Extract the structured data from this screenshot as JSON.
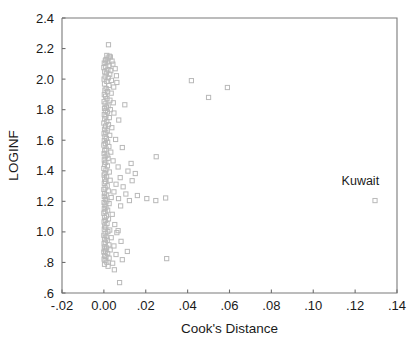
{
  "chart_data": {
    "type": "scatter",
    "title": "",
    "xlabel": "Cook's Distance",
    "ylabel": "LOGINF",
    "xlim": [
      -0.02,
      0.14
    ],
    "ylim": [
      0.6,
      2.4
    ],
    "grid": false,
    "legend": "none",
    "xticks": [
      "-.02",
      "0.00",
      ".02",
      ".04",
      ".06",
      ".08",
      ".10",
      ".12",
      ".14"
    ],
    "xtick_values": [
      -0.02,
      0.0,
      0.02,
      0.04,
      0.06,
      0.08,
      0.1,
      0.12,
      0.14
    ],
    "yticks": [
      "2.4",
      "2.2",
      "2.0",
      "1.8",
      "1.6",
      "1.4",
      "1.2",
      "1.0",
      ".8",
      ".6"
    ],
    "ytick_values": [
      2.4,
      2.2,
      2.0,
      1.8,
      1.6,
      1.4,
      1.2,
      1.0,
      0.8,
      0.6
    ],
    "marker": "open-square",
    "marker_color": "#b9b9b9",
    "annotations": [
      {
        "text": "Kuwait",
        "x": 0.1295,
        "y": 1.205,
        "label_x": 0.1225,
        "label_y": 1.305
      }
    ],
    "points": [
      [
        0.0022,
        2.225
      ],
      [
        0.0014,
        2.155
      ],
      [
        0.0026,
        2.15
      ],
      [
        0.0031,
        2.145
      ],
      [
        0.002,
        2.138
      ],
      [
        0.001,
        2.128
      ],
      [
        0.0007,
        2.12
      ],
      [
        0.0039,
        2.118
      ],
      [
        0.0016,
        2.112
      ],
      [
        0.0002,
        2.105
      ],
      [
        0.0043,
        2.098
      ],
      [
        0.0025,
        2.09
      ],
      [
        0.0009,
        2.082
      ],
      [
        0.0,
        2.075
      ],
      [
        0.0054,
        2.068
      ],
      [
        0.0019,
        2.06
      ],
      [
        0.0033,
        2.055
      ],
      [
        0.0004,
        2.048
      ],
      [
        0.0012,
        2.04
      ],
      [
        0.0028,
        2.032
      ],
      [
        0.006,
        2.022
      ],
      [
        0.0006,
        2.015
      ],
      [
        0.0021,
        2.008
      ],
      [
        0.0001,
        2.0
      ],
      [
        0.0036,
        1.992
      ],
      [
        0.0014,
        1.985
      ],
      [
        0.0062,
        1.978
      ],
      [
        0.0003,
        1.968
      ],
      [
        0.0024,
        1.958
      ],
      [
        0.0047,
        1.948
      ],
      [
        0.059,
        1.945
      ],
      [
        0.0011,
        1.938
      ],
      [
        0.0005,
        1.928
      ],
      [
        0.0418,
        1.99
      ],
      [
        0.0018,
        1.918
      ],
      [
        0.0035,
        1.908
      ],
      [
        0.0002,
        1.898
      ],
      [
        0.0008,
        1.888
      ],
      [
        0.05,
        1.88
      ],
      [
        0.0015,
        1.872
      ],
      [
        0.0029,
        1.862
      ],
      [
        0.0001,
        1.852
      ],
      [
        0.0045,
        1.845
      ],
      [
        0.0006,
        1.838
      ],
      [
        0.01,
        1.832
      ],
      [
        0.002,
        1.825
      ],
      [
        0.0012,
        1.818
      ],
      [
        0.0003,
        1.808
      ],
      [
        0.0031,
        1.8
      ],
      [
        0.0007,
        1.792
      ],
      [
        0.0017,
        1.785
      ],
      [
        0.0048,
        1.778
      ],
      [
        0.0002,
        1.768
      ],
      [
        0.001,
        1.758
      ],
      [
        0.0026,
        1.748
      ],
      [
        0.0004,
        1.74
      ],
      [
        0.0071,
        1.732
      ],
      [
        0.0014,
        1.722
      ],
      [
        0.0,
        1.712
      ],
      [
        0.0022,
        1.702
      ],
      [
        0.0008,
        1.692
      ],
      [
        0.0038,
        1.682
      ],
      [
        0.0003,
        1.672
      ],
      [
        0.0016,
        1.662
      ],
      [
        0.0009,
        1.652
      ],
      [
        0.0001,
        1.642
      ],
      [
        0.0028,
        1.632
      ],
      [
        0.0005,
        1.622
      ],
      [
        0.0012,
        1.612
      ],
      [
        0.0056,
        1.605
      ],
      [
        0.0002,
        1.598
      ],
      [
        0.0018,
        1.588
      ],
      [
        0.0007,
        1.578
      ],
      [
        0.0,
        1.568
      ],
      [
        0.0024,
        1.558
      ],
      [
        0.0088,
        1.552
      ],
      [
        0.0011,
        1.542
      ],
      [
        0.0004,
        1.532
      ],
      [
        0.0033,
        1.522
      ],
      [
        0.0001,
        1.512
      ],
      [
        0.0015,
        1.502
      ],
      [
        0.0006,
        1.492
      ],
      [
        0.025,
        1.492
      ],
      [
        0.002,
        1.482
      ],
      [
        0.0002,
        1.472
      ],
      [
        0.0044,
        1.465
      ],
      [
        0.0009,
        1.455
      ],
      [
        0.013,
        1.448
      ],
      [
        0.0003,
        1.442
      ],
      [
        0.0017,
        1.432
      ],
      [
        0.0068,
        1.425
      ],
      [
        0.0,
        1.415
      ],
      [
        0.001,
        1.405
      ],
      [
        0.0115,
        1.398
      ],
      [
        0.0026,
        1.392
      ],
      [
        0.0005,
        1.382
      ],
      [
        0.015,
        1.382
      ],
      [
        0.0001,
        1.372
      ],
      [
        0.0013,
        1.362
      ],
      [
        0.0078,
        1.355
      ],
      [
        0.0004,
        1.345
      ],
      [
        0.003,
        1.338
      ],
      [
        0.0135,
        1.335
      ],
      [
        0.0008,
        1.328
      ],
      [
        0.0002,
        1.318
      ],
      [
        0.0058,
        1.312
      ],
      [
        0.0016,
        1.302
      ],
      [
        0.0092,
        1.295
      ],
      [
        0.0006,
        1.288
      ],
      [
        0.0,
        1.278
      ],
      [
        0.0021,
        1.268
      ],
      [
        0.0048,
        1.262
      ],
      [
        0.0003,
        1.252
      ],
      [
        0.0105,
        1.248
      ],
      [
        0.0011,
        1.242
      ],
      [
        0.016,
        1.238
      ],
      [
        0.0295,
        1.222
      ],
      [
        0.0002,
        1.232
      ],
      [
        0.0035,
        1.225
      ],
      [
        0.007,
        1.218
      ],
      [
        0.0007,
        1.212
      ],
      [
        0.0205,
        1.218
      ],
      [
        0.0122,
        1.205
      ],
      [
        0.0014,
        1.202
      ],
      [
        0.0001,
        1.192
      ],
      [
        0.0248,
        1.205
      ],
      [
        0.0025,
        1.185
      ],
      [
        0.0005,
        1.175
      ],
      [
        0.008,
        1.17
      ],
      [
        0.001,
        1.162
      ],
      [
        0.0002,
        1.152
      ],
      [
        0.0018,
        1.142
      ],
      [
        0.0006,
        1.132
      ],
      [
        0.0,
        1.122
      ],
      [
        0.004,
        1.115
      ],
      [
        0.0012,
        1.105
      ],
      [
        0.0003,
        1.095
      ],
      [
        0.0022,
        1.085
      ],
      [
        0.0068,
        1.008
      ],
      [
        0.0007,
        1.075
      ],
      [
        0.0001,
        1.065
      ],
      [
        0.0015,
        1.055
      ],
      [
        0.0052,
        1.048
      ],
      [
        0.0004,
        1.038
      ],
      [
        0.0009,
        1.028
      ],
      [
        0.0002,
        1.018
      ],
      [
        0.0028,
        1.012
      ],
      [
        0.0019,
        1.002
      ],
      [
        0.0062,
        0.995
      ],
      [
        0.0006,
        0.988
      ],
      [
        0.0,
        0.978
      ],
      [
        0.0011,
        0.968
      ],
      [
        0.0035,
        0.962
      ],
      [
        0.0003,
        0.952
      ],
      [
        0.0016,
        0.945
      ],
      [
        0.0082,
        0.938
      ],
      [
        0.0007,
        0.932
      ],
      [
        0.0001,
        0.922
      ],
      [
        0.0024,
        0.915
      ],
      [
        0.0048,
        0.908
      ],
      [
        0.0005,
        0.902
      ],
      [
        0.0013,
        0.895
      ],
      [
        0.0002,
        0.888
      ],
      [
        0.003,
        0.882
      ],
      [
        0.0008,
        0.875
      ],
      [
        0.0112,
        0.872
      ],
      [
        0.0,
        0.868
      ],
      [
        0.0018,
        0.858
      ],
      [
        0.0058,
        0.852
      ],
      [
        0.0004,
        0.845
      ],
      [
        0.03,
        0.825
      ],
      [
        0.001,
        0.838
      ],
      [
        0.0025,
        0.828
      ],
      [
        0.0001,
        0.822
      ],
      [
        0.0088,
        0.818
      ],
      [
        0.0006,
        0.812
      ],
      [
        0.0014,
        0.802
      ],
      [
        0.0042,
        0.795
      ],
      [
        0.0003,
        0.788
      ],
      [
        0.002,
        0.775
      ],
      [
        0.005,
        0.752
      ],
      [
        0.0075,
        0.668
      ],
      [
        0.1295,
        1.205
      ]
    ]
  }
}
